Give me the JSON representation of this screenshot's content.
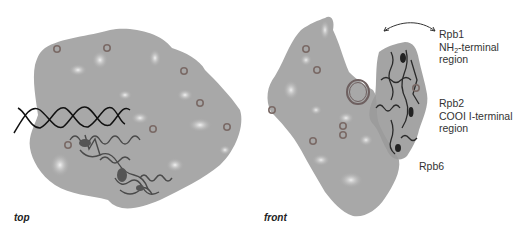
{
  "figure": {
    "panels": [
      {
        "id": "top",
        "view_label": "top",
        "elements": [
          "protein surface (gray)",
          "DNA double helix",
          "ribbon structure",
          "marker rings"
        ]
      },
      {
        "id": "front",
        "view_label": "front",
        "elements": [
          "protein surface (gray)",
          "ring (DNA end-on)",
          "ribbon structure",
          "marker rings",
          "double-headed curved arrow"
        ]
      }
    ],
    "annotations": {
      "rpb1": {
        "line1": "Rpb1",
        "line2_pre": "NH",
        "line2_sub": "2",
        "line2_post": "-terminal",
        "line3": "region"
      },
      "rpb2": {
        "line1": "Rpb2",
        "line2": "COOI I-terminal",
        "line3": "region"
      },
      "rpb6": {
        "line1": "Rpb6"
      }
    },
    "colors": {
      "surface": "#a8a8a8",
      "surface_highlight": "#e6e6e6",
      "marker": "#7a6a66",
      "helix": "#111111",
      "text": "#333333"
    }
  }
}
